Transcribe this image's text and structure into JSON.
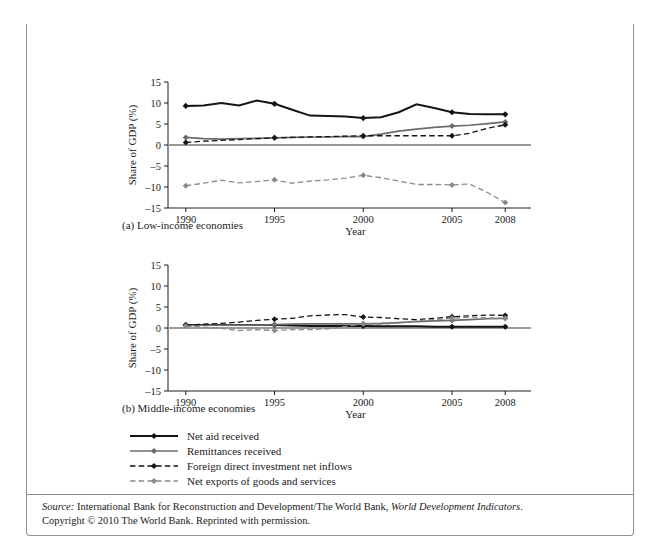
{
  "figure": {
    "number_label": "FIGURE 14.3",
    "title": "Sources of External Financing for Developing Countries, 1990–2008"
  },
  "legend": {
    "items": [
      {
        "label": "Net aid received",
        "style": "solid-black-diamond",
        "color": "#141414",
        "dash": false
      },
      {
        "label": "Remittances received",
        "style": "solid-gray-diamond",
        "color": "#6b6b6b",
        "dash": false
      },
      {
        "label": "Foreign direct investment net inflows",
        "style": "dashed-black-diamond",
        "color": "#141414",
        "dash": true
      },
      {
        "label": "Net exports of goods and services",
        "style": "dashed-gray-diamond",
        "color": "#8a8a8a",
        "dash": true
      }
    ]
  },
  "source": {
    "source_word": "Source:",
    "line1_rest": " International Bank for Reconstruction and Development/The World Bank, ",
    "italic_title": "World Development Indicators",
    "line1_end": ".",
    "line2": "Copyright © 2010 The World Bank. Reprinted with permission."
  },
  "chart_data": [
    {
      "type": "line",
      "panel": "a",
      "title": "(a) Low-income economies",
      "xlabel": "Year",
      "ylabel": "Share of GDP (%)",
      "xlim": [
        1989,
        2009
      ],
      "ylim": [
        -15,
        15
      ],
      "yticks": [
        15,
        10,
        5,
        0,
        -5,
        -10,
        -15
      ],
      "xticks": [
        1990,
        1995,
        2000,
        2005,
        2008
      ],
      "grid": false,
      "legend_position": "below-figure",
      "marker_years": [
        1990,
        1995,
        2000,
        2005,
        2008
      ],
      "x": [
        1990,
        1991,
        1992,
        1993,
        1994,
        1995,
        1996,
        1997,
        1998,
        1999,
        2000,
        2001,
        2002,
        2003,
        2004,
        2005,
        2006,
        2007,
        2008
      ],
      "series": [
        {
          "name": "Net aid received",
          "values": [
            9.3,
            9.4,
            10.0,
            9.4,
            10.6,
            9.8,
            8.4,
            7.0,
            6.9,
            6.8,
            6.4,
            6.6,
            7.8,
            9.7,
            8.8,
            7.8,
            7.4,
            7.3,
            7.3
          ]
        },
        {
          "name": "Remittances received",
          "values": [
            1.8,
            1.5,
            1.4,
            1.5,
            1.6,
            1.7,
            1.8,
            1.9,
            1.9,
            2.0,
            2.0,
            2.6,
            3.3,
            3.8,
            4.2,
            4.5,
            4.7,
            5.1,
            5.5
          ]
        },
        {
          "name": "Foreign direct investment net inflows",
          "values": [
            0.6,
            0.9,
            1.1,
            1.3,
            1.5,
            1.7,
            1.8,
            1.9,
            2.0,
            2.1,
            2.2,
            2.2,
            2.2,
            2.2,
            2.2,
            2.2,
            2.8,
            4.0,
            4.8
          ]
        },
        {
          "name": "Net exports of goods and services",
          "values": [
            -9.7,
            -9.1,
            -8.4,
            -9.0,
            -8.7,
            -8.3,
            -9.1,
            -8.6,
            -8.3,
            -7.9,
            -7.2,
            -7.8,
            -8.6,
            -9.4,
            -9.4,
            -9.5,
            -9.3,
            -11.3,
            -13.7
          ]
        }
      ]
    },
    {
      "type": "line",
      "panel": "b",
      "title": "(b) Middle-income economies",
      "xlabel": "Year",
      "ylabel": "Share of GDP (%)",
      "xlim": [
        1989,
        2009
      ],
      "ylim": [
        -15,
        15
      ],
      "yticks": [
        15,
        10,
        5,
        0,
        -5,
        -10,
        -15
      ],
      "xticks": [
        1990,
        1995,
        2000,
        2005,
        2008
      ],
      "grid": false,
      "legend_position": "below-figure",
      "marker_years": [
        1990,
        1995,
        2000,
        2005,
        2008
      ],
      "x": [
        1990,
        1991,
        1992,
        1993,
        1994,
        1995,
        1996,
        1997,
        1998,
        1999,
        2000,
        2001,
        2002,
        2003,
        2004,
        2005,
        2006,
        2007,
        2008
      ],
      "series": [
        {
          "name": "Net aid received",
          "values": [
            0.7,
            0.7,
            0.7,
            0.7,
            0.7,
            0.7,
            0.6,
            0.5,
            0.5,
            0.5,
            0.5,
            0.4,
            0.4,
            0.4,
            0.3,
            0.3,
            0.3,
            0.3,
            0.3
          ]
        },
        {
          "name": "Remittances received",
          "values": [
            0.6,
            0.7,
            0.7,
            0.7,
            0.7,
            0.8,
            0.9,
            1.0,
            1.0,
            1.0,
            1.0,
            1.1,
            1.3,
            1.5,
            1.7,
            1.8,
            2.0,
            2.2,
            2.3
          ]
        },
        {
          "name": "Foreign direct investment net inflows",
          "values": [
            0.7,
            0.9,
            1.1,
            1.4,
            1.8,
            2.1,
            2.3,
            2.9,
            3.1,
            3.2,
            2.6,
            2.5,
            2.2,
            2.0,
            2.3,
            2.7,
            2.9,
            3.1,
            3.0
          ]
        },
        {
          "name": "Net exports of goods and services",
          "values": [
            0.5,
            0.2,
            -0.1,
            -0.6,
            -0.4,
            -0.6,
            -0.4,
            -0.4,
            -0.2,
            0.4,
            1.0,
            0.9,
            1.2,
            1.7,
            2.0,
            2.3,
            2.6,
            2.4,
            2.3
          ]
        }
      ]
    }
  ]
}
